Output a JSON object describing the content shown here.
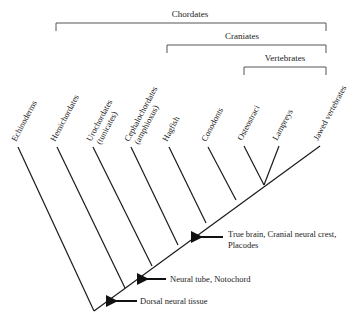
{
  "clades": [
    {
      "label": "Chordates",
      "x1": 56,
      "x2": 326,
      "y": 23,
      "label_x": 190,
      "label_y": 17
    },
    {
      "label": "Craniates",
      "x1": 167,
      "x2": 326,
      "y": 45,
      "label_x": 242,
      "label_y": 39
    },
    {
      "label": "Vertebrates",
      "x1": 244,
      "x2": 326,
      "y": 67,
      "label_x": 285,
      "label_y": 61
    }
  ],
  "taxa": [
    {
      "name": "Echinoderms",
      "line2": "",
      "tip_x": 18,
      "tip_y": 147,
      "node_x": 94,
      "node_y": 311
    },
    {
      "name": "Hemichordates",
      "line2": "",
      "tip_x": 57,
      "tip_y": 147,
      "node_x": 125,
      "node_y": 288
    },
    {
      "name": "Urochordates",
      "line2": "(tunicates)",
      "tip_x": 93,
      "tip_y": 147,
      "node_x": 152,
      "node_y": 266
    },
    {
      "name": "Cephalochordates",
      "line2": "(amphioxus)",
      "tip_x": 131,
      "tip_y": 147,
      "node_x": 178,
      "node_y": 245
    },
    {
      "name": "Hagfish",
      "line2": "",
      "tip_x": 169,
      "tip_y": 147,
      "node_x": 206,
      "node_y": 223
    },
    {
      "name": "Conodonts",
      "line2": "",
      "tip_x": 208,
      "tip_y": 147,
      "node_x": 236,
      "node_y": 200
    },
    {
      "name": "Osteostraci",
      "line2": "",
      "tip_x": 244,
      "tip_y": 146,
      "node_x": 264,
      "node_y": 185
    },
    {
      "name": "Lampreys",
      "line2": "",
      "tip_x": 279,
      "tip_y": 146,
      "node_x": 264,
      "node_y": 185
    },
    {
      "name": "Jawed vertebrates",
      "line2": "",
      "tip_x": 320,
      "tip_y": 146,
      "node_x": 320,
      "node_y": 146
    }
  ],
  "spine": {
    "x1": 94,
    "y1": 311,
    "x2": 320,
    "y2": 146
  },
  "characters": [
    {
      "lines": [
        "Dorsal neural tissue"
      ],
      "arrow_tip_x": 111,
      "arrow_y": 301,
      "arrow_tail_x": 137,
      "text_x": 140,
      "text_y": 304
    },
    {
      "lines": [
        "Neural tube, Notochord"
      ],
      "arrow_tip_x": 142,
      "arrow_y": 279,
      "arrow_tail_x": 166,
      "text_x": 170,
      "text_y": 282
    },
    {
      "lines": [
        "True brain, Cranial neural crest,",
        "Placodes"
      ],
      "arrow_tip_x": 196,
      "arrow_y": 237,
      "arrow_tail_x": 223,
      "text_x": 228,
      "text_y": 237
    }
  ]
}
